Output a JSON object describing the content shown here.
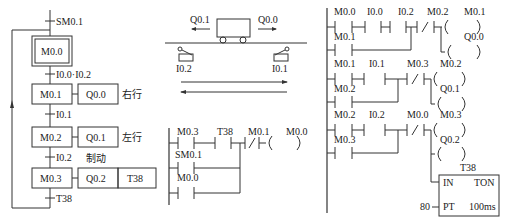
{
  "sfc": {
    "init_transition": "SM0.1",
    "steps": [
      {
        "id": "M0.0",
        "initial": true
      },
      {
        "id": "M0.1",
        "action": "Q0.0",
        "note": "右行"
      },
      {
        "id": "M0.2",
        "action": "Q0.1",
        "note": "左行"
      },
      {
        "id": "M0.3",
        "action": "Q0.2",
        "timer": "T38",
        "note": "制动"
      }
    ],
    "transitions": [
      "I0.0·I0.2",
      "I0.1",
      "I0.2",
      "T38"
    ]
  },
  "cart": {
    "left_output": "Q0.1",
    "right_output": "Q0.0",
    "left_switch": "I0.2",
    "right_switch": "I0.1"
  },
  "ladder_mid": {
    "contacts": {
      "m03": "M0.3",
      "t38": "T38",
      "m01": "M0.1",
      "sm01": "SM0.1",
      "m00": "M0.0"
    },
    "coil": "M0.0"
  },
  "ladder_right": {
    "rung1": {
      "c1": "M0.0",
      "c2": "I0.0",
      "c3": "I0.2",
      "nc": "M0.2",
      "par": "M0.1",
      "coil1": "M0.1",
      "coil2": "Q0.0"
    },
    "rung2": {
      "c1": "M0.1",
      "c2": "I0.1",
      "nc": "M0.3",
      "par": "M0.2",
      "coil1": "M0.2",
      "coil2": "Q0.1"
    },
    "rung3": {
      "c1": "M0.2",
      "c2": "I0.2",
      "nc": "M0.0",
      "par": "M0.3",
      "coil1": "M0.3",
      "coil2": "Q0.2"
    },
    "timer": {
      "name": "T38",
      "in": "IN",
      "type": "TON",
      "pt_label": "PT",
      "pt_value": "80",
      "base": "100ms"
    }
  }
}
